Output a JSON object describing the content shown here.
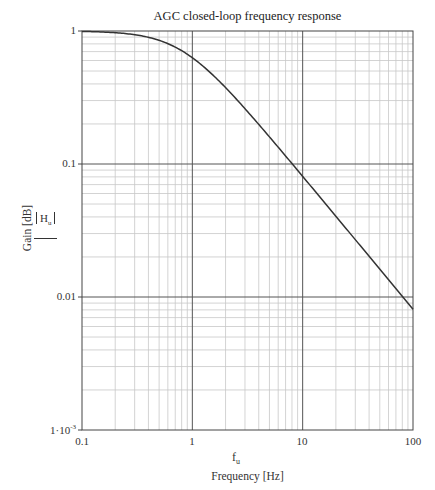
{
  "chart_data": {
    "type": "line",
    "title": "AGC closed-loop frequency response",
    "xlabel_var": "f",
    "xlabel_var_sub": "u",
    "xlabel": "Frequency [Hz]",
    "ylabel": "Gain [dB]",
    "ylabel_var": "H",
    "ylabel_var_sub": "u",
    "xscale": "log",
    "yscale": "log",
    "xlim": [
      0.1,
      100
    ],
    "ylim": [
      0.001,
      1
    ],
    "xticks": [
      "0.1",
      "1",
      "10",
      "100"
    ],
    "yticks": [
      "1",
      "0.1",
      "0.01",
      "1·10⁻³"
    ],
    "grid": true,
    "series": [
      {
        "name": "|Hu|",
        "x": [
          0.1,
          0.2,
          0.3,
          0.4,
          0.5,
          0.6,
          0.7,
          0.8,
          1,
          1.5,
          2,
          3,
          4,
          5,
          7,
          10,
          20,
          30,
          50,
          70,
          100
        ],
        "y": [
          0.992,
          0.971,
          0.938,
          0.897,
          0.851,
          0.803,
          0.756,
          0.711,
          0.629,
          0.475,
          0.375,
          0.261,
          0.199,
          0.16,
          0.115,
          0.081,
          0.0405,
          0.027,
          0.0162,
          0.0116,
          0.0081
        ]
      }
    ]
  },
  "labels": {
    "title": "AGC closed-loop frequency response",
    "xticks": [
      "0.1",
      "1",
      "10",
      "100"
    ],
    "yticks": [
      "1",
      "0.1",
      "0.01",
      "1·10"
    ],
    "ytick_exp": "-3",
    "xvar": "f",
    "xvar_sub": "u",
    "xaxis_title": "Frequency [Hz]",
    "yaxis_title": "Gain [dB]",
    "yvar": "H",
    "yvar_sub": "u"
  }
}
